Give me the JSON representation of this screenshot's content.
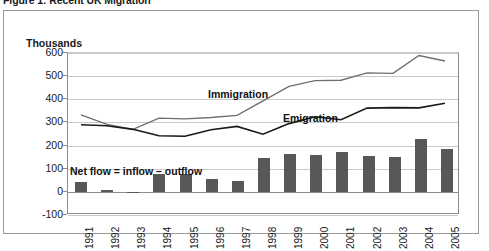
{
  "figure": {
    "caption": "Figure 1: Recent UK Migration"
  },
  "axes": {
    "y_unit_label": "Thousands",
    "y_ticks": [
      "600",
      "500",
      "400",
      "300",
      "200",
      "100",
      "0",
      "-100"
    ],
    "x_ticks": [
      "1991",
      "1992",
      "1993",
      "1994",
      "1995",
      "1996",
      "1997",
      "1998",
      "1999",
      "2000",
      "2001",
      "2002",
      "2003",
      "2004",
      "2005"
    ]
  },
  "annotations": {
    "immigration": "Immigration",
    "emigration": "Emigration",
    "net_flow": "Net flow = inflow – outflow"
  },
  "colors": {
    "immigration_line": "#6f6f6f",
    "emigration_line": "#1a1a1a",
    "net_flow_bar": "#585858",
    "gridline": "#c9c9c9",
    "axis": "#8c8c8c",
    "frame": "#9a9a9a",
    "background": "#ffffff"
  },
  "chart_data": {
    "type": "line",
    "title": "Figure 1: Recent UK Migration",
    "xlabel": "",
    "ylabel": "Thousands",
    "ylim": [
      -100,
      600
    ],
    "ytick_step": 100,
    "grid": true,
    "legend": "inline-annotations",
    "x": [
      "1991",
      "1992",
      "1993",
      "1994",
      "1995",
      "1996",
      "1997",
      "1998",
      "1999",
      "2000",
      "2001",
      "2002",
      "2003",
      "2004",
      "2005"
    ],
    "series": [
      {
        "name": "Immigration",
        "type": "line",
        "color": "#6f6f6f",
        "values": [
          329,
          288,
          266,
          315,
          312,
          318,
          327,
          391,
          454,
          479,
          481,
          513,
          511,
          589,
          565
        ]
      },
      {
        "name": "Emigration",
        "type": "line",
        "color": "#1a1a1a",
        "values": [
          286,
          282,
          266,
          238,
          236,
          264,
          279,
          245,
          291,
          321,
          308,
          359,
          361,
          360,
          380
        ]
      },
      {
        "name": "Net flow = inflow – outflow",
        "type": "bar",
        "color": "#585858",
        "values": [
          43,
          6,
          0,
          77,
          76,
          54,
          48,
          146,
          163,
          158,
          173,
          154,
          150,
          229,
          185
        ]
      }
    ]
  }
}
